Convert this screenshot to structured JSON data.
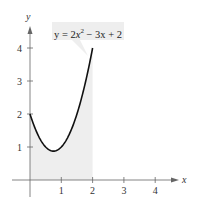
{
  "chart_data": {
    "type": "line",
    "title": "",
    "annotation": "y = 2x^2 - 3x + 2",
    "equation": {
      "pre": "y = 2",
      "var": "x",
      "exp": "2",
      "post": " − 3x + 2"
    },
    "xlabel": "x",
    "ylabel": "y",
    "xlim": [
      0,
      4.6
    ],
    "ylim": [
      0,
      4.6
    ],
    "x_ticks": [
      "1",
      "2",
      "3",
      "4"
    ],
    "y_ticks": [
      "1",
      "2",
      "3",
      "4"
    ],
    "grid": false,
    "shaded_region": {
      "x_from": 0,
      "x_to": 2,
      "under": "curve",
      "color": "#eeeeee"
    },
    "series": [
      {
        "name": "y = 2x^2 - 3x + 2",
        "x": [
          0,
          0.25,
          0.5,
          0.75,
          1,
          1.25,
          1.5,
          1.75,
          2
        ],
        "values": [
          2,
          1.375,
          1,
          0.875,
          1,
          1.375,
          2,
          2.875,
          4
        ],
        "color": "#111111"
      }
    ]
  }
}
